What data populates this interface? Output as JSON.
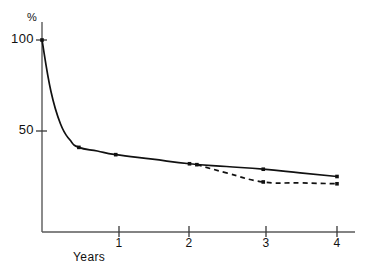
{
  "chart_data": {
    "type": "line",
    "title": "",
    "subtitle": "",
    "xlabel": "Years",
    "ylabel": "",
    "unit_label": "%",
    "xlim": [
      0,
      4.15
    ],
    "ylim": [
      0,
      110
    ],
    "grid": false,
    "legend": "none",
    "x_ticks": [
      1,
      2,
      3,
      4
    ],
    "x_tick_labels": [
      "1",
      "2",
      "3",
      "4"
    ],
    "y_ticks": [
      50,
      100
    ],
    "y_tick_labels": [
      "50",
      "100"
    ],
    "series": [
      {
        "name": "solid-curve",
        "style": "solid",
        "color": "#111111",
        "x": [
          0,
          0.12,
          0.25,
          0.38,
          0.5,
          0.75,
          1,
          1.5,
          2,
          2.5,
          3,
          3.5,
          4
        ],
        "values": [
          100,
          72,
          54,
          45,
          41,
          39,
          37,
          34.5,
          32,
          30.5,
          29,
          27,
          25
        ],
        "markers_x": [
          0,
          0.5,
          1,
          2,
          3,
          4
        ],
        "markers_y": [
          100,
          41,
          37,
          32,
          29,
          25
        ]
      },
      {
        "name": "dashed-branch",
        "style": "dashed",
        "color": "#111111",
        "x": [
          2.1,
          2.5,
          3,
          3.5,
          4
        ],
        "values": [
          31.5,
          27,
          22,
          21.5,
          21
        ],
        "markers_x": [
          2.1,
          3,
          4
        ],
        "markers_y": [
          31.5,
          22,
          21
        ]
      }
    ],
    "annotations": []
  },
  "axes": {
    "y_unit": "%",
    "y_tick_100": "100",
    "y_tick_50": "50",
    "x_tick_1": "1",
    "x_tick_2": "2",
    "x_tick_3": "3",
    "x_tick_4": "4",
    "x_axis_title": "Years"
  },
  "colors": {
    "background": "#ffffff",
    "axis": "#5a5a5a",
    "line": "#111111",
    "text": "#111111"
  }
}
